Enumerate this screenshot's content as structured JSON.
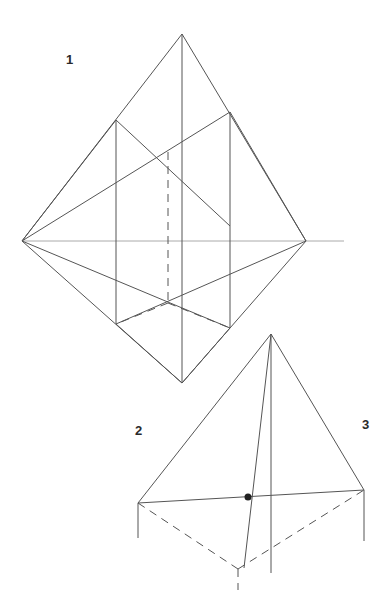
{
  "figures": [
    {
      "label": "1",
      "label_pos": [
        66,
        53
      ],
      "solid": [
        [
          182,
          34,
          22,
          241
        ],
        [
          182,
          34,
          306,
          241
        ],
        [
          22,
          241,
          182,
          383
        ],
        [
          306,
          241,
          182,
          383
        ],
        [
          182,
          34,
          182,
          383
        ],
        [
          116,
          120,
          116,
          324
        ],
        [
          230,
          112,
          230,
          328
        ],
        [
          116,
          120,
          230,
          226
        ],
        [
          230,
          112,
          22,
          241
        ],
        [
          116,
          120,
          22,
          241
        ],
        [
          230,
          112,
          306,
          241
        ],
        [
          116,
          324,
          306,
          241
        ],
        [
          230,
          328,
          22,
          241
        ],
        [
          116,
          324,
          182,
          383
        ],
        [
          230,
          328,
          182,
          383
        ]
      ],
      "dashed": [
        [
          168,
          152,
          168,
          303
        ],
        [
          168,
          303,
          116,
          324
        ],
        [
          168,
          303,
          230,
          328
        ]
      ],
      "axis": [
        [
          22,
          241,
          344,
          241
        ]
      ],
      "dots": []
    },
    {
      "label": "2",
      "label_pos": [
        135,
        424
      ],
      "solid": [
        [
          271,
          334,
          138,
          503
        ],
        [
          271,
          334,
          364,
          490
        ],
        [
          271,
          334,
          244,
          568
        ],
        [
          271,
          334,
          271,
          573
        ],
        [
          138,
          503,
          364,
          490
        ],
        [
          138,
          503,
          138,
          538
        ],
        [
          364,
          490,
          364,
          541
        ]
      ],
      "dashed": [
        [
          138,
          503,
          238,
          569
        ],
        [
          238,
          569,
          364,
          490
        ],
        [
          238,
          569,
          238,
          590
        ]
      ],
      "axis": [],
      "dots": [
        [
          248,
          497,
          3.5
        ]
      ]
    },
    {
      "label": "3",
      "label_pos": [
        362,
        418
      ]
    }
  ],
  "style": {
    "stroke": "#555555",
    "axis_stroke": "#aaaaaa",
    "dot_fill": "#222222"
  }
}
